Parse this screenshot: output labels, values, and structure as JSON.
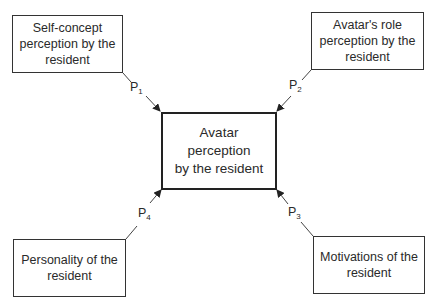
{
  "diagram": {
    "center": {
      "label": "Avatar perception\nby the resident"
    },
    "nodes": [
      {
        "id": "self-concept",
        "label": "Self-concept\nperception by the\nresident"
      },
      {
        "id": "avatar-role",
        "label": "Avatar's role\nperception by the\nresident"
      },
      {
        "id": "motivations",
        "label": "Motivations of the\nresident"
      },
      {
        "id": "personality",
        "label": "Personality of the\nresident"
      }
    ],
    "edges": [
      {
        "from": "self-concept",
        "to": "center",
        "label": "P",
        "sub": "1"
      },
      {
        "from": "avatar-role",
        "to": "center",
        "label": "P",
        "sub": "2"
      },
      {
        "from": "motivations",
        "to": "center",
        "label": "P",
        "sub": "3"
      },
      {
        "from": "personality",
        "to": "center",
        "label": "P",
        "sub": "4"
      }
    ],
    "colors": {
      "line": "#333333",
      "text": "#2a2a2a"
    }
  }
}
